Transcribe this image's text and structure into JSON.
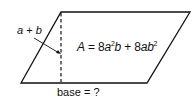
{
  "diagram": {
    "shape": "parallelogram",
    "height_label": {
      "var1": "a",
      "op": "+",
      "var2": "b"
    },
    "area_label": {
      "lhs": "A",
      "eq": "=",
      "term1_coef": "8",
      "term1_var1": "a",
      "term1_exp": "2",
      "term1_var2": "b",
      "plus": "+",
      "term2_coef": "8",
      "term2_var1": "a",
      "term2_var2": "b",
      "term2_exp": "2"
    },
    "base_label": {
      "text": "base",
      "eq": "=",
      "value": "?"
    },
    "colors": {
      "stroke": "#111111",
      "background": "#ffffff"
    }
  }
}
